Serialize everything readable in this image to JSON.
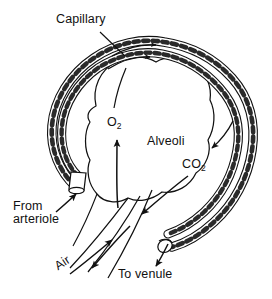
{
  "figure": {
    "style": {
      "background": "#ffffff",
      "ink": "#111111",
      "line_weight": "thin"
    }
  },
  "labels": {
    "capillary": "Capillary",
    "alveoli": "Alveoli",
    "oxygen": "O",
    "oxygen_subscript": "2",
    "carbon_dioxide": "CO",
    "carbon_dioxide_subscript": "2",
    "from_arteriole_line1": "From",
    "from_arteriole_line2": "arteriole",
    "air": "Air",
    "to_venule": "To venule"
  },
  "structures": {
    "alveolus": "lobed air sac at center of figure",
    "capillary": "beaded braided vessel wrapping around the alveolus",
    "arteriole_stub": "cut capillary tube at lower left",
    "venule_stub": "cut capillary tube at lower right",
    "air_duct": "paired bronchiole lines entering from lower left"
  },
  "flow_arrows": [
    {
      "name": "blood-inflow-arrow",
      "meaning": "blood enters from arteriole",
      "direction": "up-right"
    },
    {
      "name": "capillary-flow-arrow-top-outer",
      "meaning": "blood flow along outer capillary",
      "direction": "right"
    },
    {
      "name": "capillary-flow-arrow-top-inner",
      "meaning": "blood flow along inner capillary",
      "direction": "right"
    },
    {
      "name": "blood-outflow-arrow",
      "meaning": "blood leaves to venule",
      "direction": "down-left"
    },
    {
      "name": "oxygen-diffusion-arrow",
      "meaning": "O2 moves from alveolus into blood",
      "direction": "up"
    },
    {
      "name": "carbon-dioxide-diffusion-arrow",
      "meaning": "CO2 moves from blood into alveolus",
      "direction": "down-left"
    },
    {
      "name": "co2-entry-arrow-right",
      "meaning": "CO2 carried in blood on right side",
      "direction": "down-left"
    },
    {
      "name": "air-inflow-arrow",
      "meaning": "air flows into alveolus",
      "direction": "up-right"
    },
    {
      "name": "air-outflow-arrow",
      "meaning": "air flows out of alveolus",
      "direction": "down-left"
    }
  ]
}
